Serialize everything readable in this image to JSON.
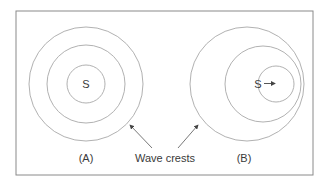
{
  "figure": {
    "panel_a": {
      "label": "(A)",
      "source_label": "S",
      "description": "Stationary source: concentric wave crests"
    },
    "panel_b": {
      "label": "(B)",
      "source_label": "S",
      "description": "Moving source: wave crests bunched in direction of motion"
    },
    "annotation": "Wave crests",
    "colors": {
      "border": "#8a8a8a",
      "circle": "#a8a8a8",
      "text": "#3a3a3a",
      "arrow": "#555555"
    }
  }
}
